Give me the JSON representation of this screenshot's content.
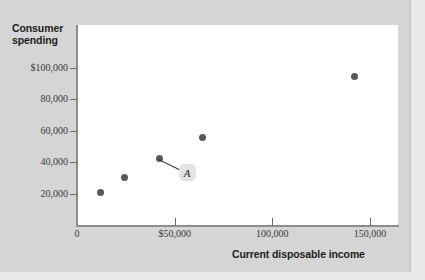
{
  "chart_data": {
    "type": "scatter",
    "title": "",
    "xlabel": "Current disposable income",
    "ylabel": "Consumer spending",
    "ylabel_line1": "Consumer",
    "ylabel_line2": "spending",
    "xlim": [
      0,
      163000
    ],
    "ylim": [
      0,
      128000
    ],
    "grid": false,
    "legend": "none",
    "x_ticks": [
      {
        "value": 0,
        "label": "0"
      },
      {
        "value": 50000,
        "label": "$50,000"
      },
      {
        "value": 100000,
        "label": "100,000"
      },
      {
        "value": 150000,
        "label": "150,000"
      }
    ],
    "y_ticks": [
      {
        "value": 100000,
        "label": "$100,000"
      },
      {
        "value": 80000,
        "label": "80,000"
      },
      {
        "value": 60000,
        "label": "60,000"
      },
      {
        "value": 40000,
        "label": "40,000"
      },
      {
        "value": 20000,
        "label": "20,000"
      }
    ],
    "points": [
      {
        "x": 12000,
        "y": 20500,
        "label": ""
      },
      {
        "x": 24500,
        "y": 30000,
        "label": ""
      },
      {
        "x": 42000,
        "y": 42000,
        "label": "A"
      },
      {
        "x": 64000,
        "y": 56000,
        "label": ""
      },
      {
        "x": 142000,
        "y": 94500,
        "label": ""
      }
    ],
    "annotations": [
      {
        "text": "A",
        "point_index": 2
      }
    ],
    "colors": {
      "point": "#595959",
      "plot_background": "#ffffff",
      "figure_background": "#d5d5d5",
      "axis": "#8d8d8d",
      "text": "#1d1d1d",
      "annotation_box": "#e3e3e3"
    }
  }
}
